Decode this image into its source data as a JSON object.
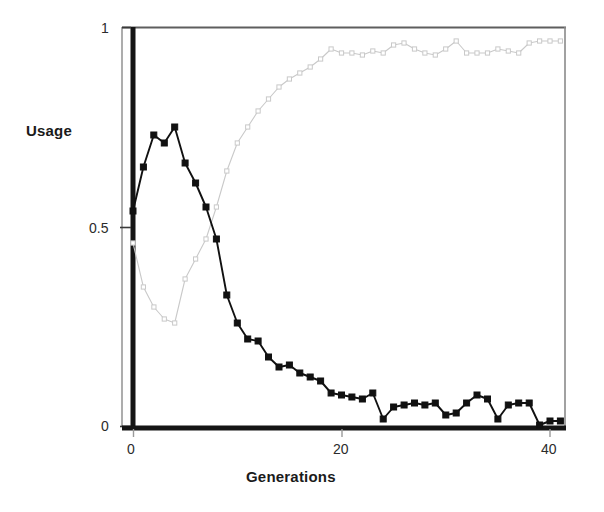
{
  "chart_data": {
    "type": "line",
    "title": "",
    "subtitle": "",
    "xlabel": "Generations",
    "ylabel": "Usage",
    "xlim": [
      0,
      42
    ],
    "ylim": [
      0,
      1
    ],
    "xticks": [
      0,
      20,
      40
    ],
    "xticklabels": [
      "0",
      "20",
      "40"
    ],
    "yticks": [
      0,
      0.5,
      1
    ],
    "yticklabels": [
      "0",
      "0.5",
      "1"
    ],
    "grid": false,
    "legend": "none",
    "frame": "box",
    "colors": {
      "series_dark": "#111111",
      "series_light": "#c9c9c9",
      "axis": "#1a1a1a",
      "frame": "#707070",
      "background": "#ffffff"
    },
    "x": [
      0,
      1,
      2,
      3,
      4,
      5,
      6,
      7,
      8,
      9,
      10,
      11,
      12,
      13,
      14,
      15,
      16,
      17,
      18,
      19,
      20,
      21,
      22,
      23,
      24,
      25,
      26,
      27,
      28,
      29,
      30,
      31,
      32,
      33,
      34,
      35,
      36,
      37,
      38,
      39,
      40,
      41
    ],
    "series": [
      {
        "name": "dark-series",
        "marker": "filled-square",
        "color": "#111111",
        "values": [
          0.54,
          0.65,
          0.73,
          0.71,
          0.75,
          0.66,
          0.61,
          0.55,
          0.47,
          0.33,
          0.26,
          0.22,
          0.215,
          0.175,
          0.15,
          0.155,
          0.135,
          0.125,
          0.115,
          0.085,
          0.08,
          0.075,
          0.07,
          0.085,
          0.02,
          0.05,
          0.055,
          0.06,
          0.055,
          0.06,
          0.03,
          0.035,
          0.06,
          0.08,
          0.07,
          0.02,
          0.055,
          0.06,
          0.06,
          0.005,
          0.015,
          0.015
        ]
      },
      {
        "name": "light-series",
        "marker": "open-square",
        "color": "#c9c9c9",
        "values": [
          0.46,
          0.35,
          0.3,
          0.27,
          0.26,
          0.37,
          0.42,
          0.47,
          0.55,
          0.64,
          0.71,
          0.75,
          0.79,
          0.82,
          0.85,
          0.87,
          0.885,
          0.9,
          0.92,
          0.945,
          0.935,
          0.935,
          0.93,
          0.94,
          0.935,
          0.955,
          0.96,
          0.945,
          0.935,
          0.93,
          0.945,
          0.965,
          0.935,
          0.935,
          0.935,
          0.945,
          0.94,
          0.935,
          0.96,
          0.965,
          0.965,
          0.965
        ]
      }
    ]
  },
  "axes": {
    "ylabel": "Usage",
    "xlabel": "Generations",
    "ytick_labels": [
      "1",
      "0.5",
      "0"
    ],
    "xtick_labels": [
      "0",
      "20",
      "40"
    ]
  }
}
